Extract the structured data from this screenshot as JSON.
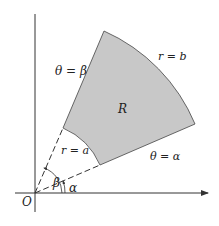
{
  "diagram": {
    "region_label": "R",
    "outer_arc_label": "r = b",
    "inner_arc_label": "r = a",
    "upper_ray_label": "θ = β",
    "lower_ray_label": "θ = α",
    "angle_beta_label": "β",
    "angle_alpha_label": "α",
    "origin_label": "O",
    "colors": {
      "region_fill": "#c8c8c8",
      "lines": "#333333",
      "background": "#ffffff"
    }
  }
}
